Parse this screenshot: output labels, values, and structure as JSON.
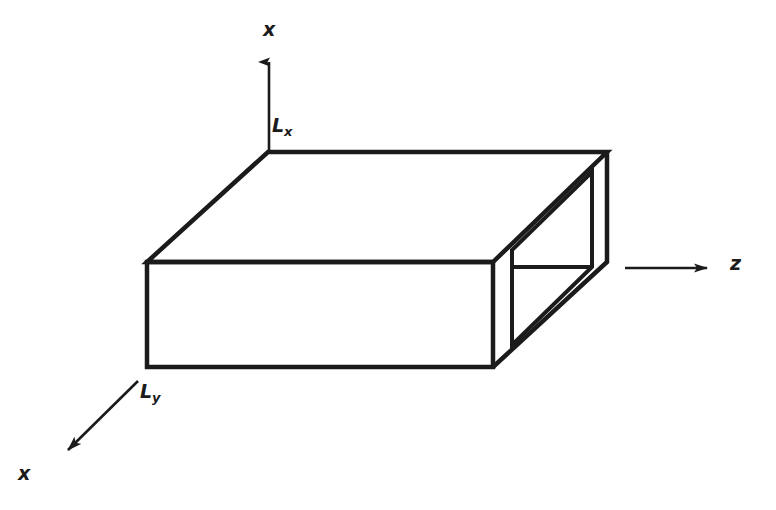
{
  "figure": {
    "background_color": "#ffffff",
    "line_color": "#1b1b1b",
    "line_width": 4
  },
  "axes": [
    {
      "id": "vertical",
      "label": "x",
      "label_sub": "",
      "direction": "up",
      "from": [
        269,
        150
      ],
      "to": [
        269,
        50
      ]
    },
    {
      "id": "depth",
      "label": "x",
      "label_sub": "",
      "direction": "down-left",
      "from": [
        138,
        381
      ],
      "to": [
        58,
        460
      ]
    },
    {
      "id": "horizontal",
      "label": "z",
      "label_sub": "",
      "direction": "right",
      "from": [
        625,
        268
      ],
      "to": [
        718,
        268
      ]
    }
  ],
  "dimensions": [
    {
      "id": "height",
      "label": "L",
      "sub": "x"
    },
    {
      "id": "depth",
      "label": "L",
      "sub": "y"
    }
  ],
  "geometry": {
    "type": "open-ended-rectangular-waveguide",
    "top_face": {
      "back_left": [
        268,
        152
      ],
      "back_right": [
        607,
        152
      ],
      "front_right": [
        493,
        262
      ],
      "front_left": [
        147,
        262
      ]
    },
    "front_face": {
      "top_left": [
        147,
        262
      ],
      "top_right": [
        493,
        262
      ],
      "bottom_right": [
        493,
        367
      ],
      "bottom_left": [
        147,
        367
      ]
    },
    "end_face_outer": {
      "top_back": [
        607,
        152
      ],
      "top_front": [
        493,
        262
      ],
      "bottom_front": [
        493,
        367
      ],
      "bottom_back": [
        607,
        262
      ]
    },
    "aperture_inner": {
      "top_back": [
        592,
        172
      ],
      "top_front": [
        512,
        250
      ],
      "bottom_front": [
        512,
        345
      ],
      "bottom_back": [
        592,
        267
      ]
    },
    "interior_back_wall_edge": {
      "from": [
        512,
        267
      ],
      "to": [
        592,
        267
      ]
    }
  }
}
